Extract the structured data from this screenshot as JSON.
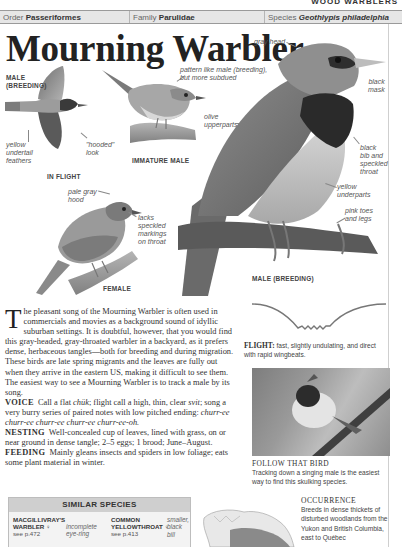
{
  "section_tag": "WOOD WARBLERS",
  "taxonomy": {
    "order_label": "Order",
    "order_value": "Passeriformes",
    "family_label": "Family",
    "family_value": "Parulidae",
    "species_label": "Species",
    "species_value": "Geothlypis philadelphia"
  },
  "title": "Mourning Warbler",
  "illustrations": {
    "in_flight": {
      "caption": "IN FLIGHT",
      "label_top": "MALE\n(BREEDING)",
      "annotations": [
        "yellow undertail feathers",
        "\"hooded\" look"
      ]
    },
    "immature_male": {
      "caption": "IMMATURE MALE",
      "annotations": [
        "pattern like male (breeding), but more subdued",
        "olive upperparts"
      ]
    },
    "female": {
      "caption": "FEMALE",
      "annotations": [
        "pale gray hood",
        "lacks speckled markings on throat"
      ]
    },
    "male_breeding": {
      "caption": "MALE (BREEDING)",
      "annotations": [
        "gray head",
        "black mask",
        "black bib and speckled throat",
        "yellow underparts",
        "pink toes and legs"
      ]
    }
  },
  "labels": {
    "male_breeding_top_1": "MALE",
    "male_breeding_top_2": "(BREEDING)",
    "yellow": "yellow",
    "undertail": "undertail",
    "feathers": "feathers",
    "hooded": "\"hooded\"",
    "look": "look",
    "in_flight": "IN FLIGHT",
    "pattern_1": "pattern like male (breeding),",
    "pattern_2": "but more subdued",
    "olive": "olive",
    "upperparts": "upperparts",
    "immature_male": "IMMATURE MALE",
    "pale_gray": "pale gray",
    "hood": "hood",
    "lacks": "lacks",
    "speckled": "speckled",
    "markings": "markings",
    "on_throat": "on throat",
    "female": "FEMALE",
    "gray_head": "gray head",
    "black": "black",
    "mask": "mask",
    "black2": "black",
    "bib_and": "bib and",
    "speckled2": "speckled",
    "throat": "throat",
    "yellow2": "yellow",
    "underparts": "underparts",
    "pink_toes": "pink toes",
    "and_legs": "and legs",
    "male_breeding": "MALE (BREEDING)"
  },
  "body": {
    "drop_cap": "T",
    "intro": "he pleasant song of the Mourning Warbler is often used in commercials and movies as a background sound of idyllic suburban settings. It is doubtful, however, that you would find this gray-headed, gray-throated warbler in a backyard, as it prefers dense, herbaceous tangles—both for breeding and during migration. These birds are late spring migrants and the leaves are fully out when they arrive in the eastern US, making it difficult to see them. The easiest way to see a Mourning Warbler is to track a male by its song.",
    "voice_label": "VOICE",
    "voice_text_1": "Call a flat ",
    "voice_call": "chük",
    "voice_text_2": "; flight call a high, thin, clear ",
    "voice_flight": "svit",
    "voice_text_3": "; song a very burry series of paired notes with low pitched ending: ",
    "voice_song": "churr-ee churr-ee churr-ee churr-ee churr-ee-oh.",
    "nesting_label": "NESTING",
    "nesting_text": "Well-concealed cup of leaves, lined with grass, on or near ground in dense tangle; 2–5 eggs; 1 brood; June–August.",
    "feeding_label": "FEEDING",
    "feeding_text": "Mainly gleans insects and spiders in low foliage; eats some plant material in winter."
  },
  "flight": {
    "label": "FLIGHT:",
    "text": " fast, slightly undulating, and direct with rapid wingbeats."
  },
  "follow": {
    "title": "FOLLOW THAT BIRD",
    "text": "Tracking down a singing male is the easiest way to find this skulking species."
  },
  "occurrence": {
    "title": "OCCURRENCE",
    "text": "Breeds in dense thickets of disturbed woodlands from the Yukon and British Columbia, east to Québec"
  },
  "similar_species": {
    "heading": "SIMILAR SPECIES",
    "items": [
      {
        "name_1": "MACGILLIVRAY'S",
        "name_2": "WARBLER ♀",
        "ref": "see p.472",
        "note_1": "incomplete",
        "note_2": "eye-ring"
      },
      {
        "name_1": "COMMON",
        "name_2": "YELLOWTHROAT ♀",
        "ref": "see p.413",
        "note_1": "smaller,",
        "note_2": "black bill"
      }
    ]
  },
  "colors": {
    "taxbar_bg": "#e6e6e6",
    "similar_head_bg": "#cfcfcf",
    "text": "#333333"
  }
}
